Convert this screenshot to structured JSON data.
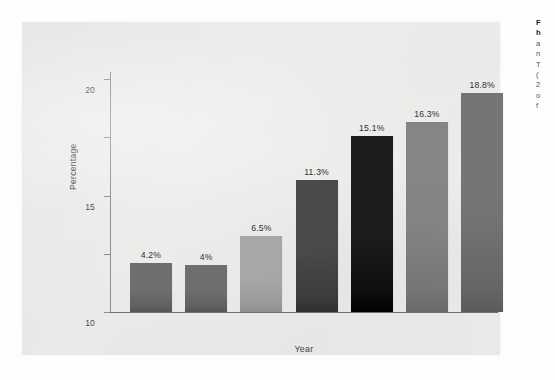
{
  "figure": {
    "panel_background": "#ececeb",
    "page_background": "#fdfdfd"
  },
  "chart_data": {
    "type": "bar",
    "title": "",
    "xlabel": "Year",
    "ylabel": "Percentage",
    "categories": [
      "1963-1965",
      "1971-1974",
      "1976-1980",
      "1988-1994",
      "1999-2000",
      "2001-2002",
      "2003-2004"
    ],
    "values": [
      4.2,
      4,
      6.5,
      11.3,
      15.1,
      16.3,
      18.8
    ],
    "value_labels": [
      "4.2%",
      "4%",
      "6.5%",
      "11.3%",
      "15.1%",
      "16.3%",
      "18.8%"
    ],
    "bar_colors": [
      "#6e6e6e",
      "#6e6e6e",
      "#a8a8a8",
      "#4a4a4a",
      "#1c1c1c",
      "#858585",
      "#757575"
    ],
    "ylim": [
      0,
      21
    ],
    "yticks": [
      0,
      5,
      10,
      15,
      20
    ],
    "ytick_labels": [
      "0",
      "5",
      "10",
      "15",
      "20"
    ],
    "grid": false,
    "legend": "none"
  },
  "caption": {
    "lines": [
      "F",
      "h",
      "a",
      "n",
      "T",
      "(",
      "2",
      "o",
      "f"
    ]
  }
}
